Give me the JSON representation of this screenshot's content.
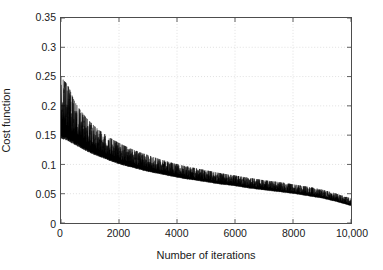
{
  "chart_data": {
    "type": "line",
    "title": "",
    "xlabel": "Number of iterations",
    "ylabel": "Cost function",
    "xlim": [
      0,
      10000
    ],
    "ylim": [
      0,
      0.35
    ],
    "grid": true,
    "legend": false,
    "legend_position": "none",
    "xticks": [
      0,
      2000,
      4000,
      6000,
      8000,
      10000
    ],
    "xticklabels": [
      "0",
      "2000",
      "4000",
      "6000",
      "8000",
      "10,000"
    ],
    "yticks": [
      0,
      0.05,
      0.1,
      0.15,
      0.2,
      0.25,
      0.3,
      0.35
    ],
    "yticklabels": [
      "0",
      "0.05",
      "0.1",
      "0.15",
      "0.2",
      "0.25",
      "0.3",
      "0.35"
    ],
    "line_color": "#000000",
    "series": [
      {
        "name": "Cost function upper envelope",
        "x": [
          0,
          100,
          200,
          300,
          400,
          500,
          700,
          900,
          1100,
          1300,
          1500,
          1800,
          2100,
          2400,
          2700,
          3000,
          3400,
          3800,
          4200,
          4600,
          5000,
          5500,
          6000,
          6500,
          7000,
          7500,
          8000,
          8500,
          9000,
          9500,
          10000
        ],
        "values": [
          0.25,
          0.243,
          0.238,
          0.228,
          0.215,
          0.205,
          0.19,
          0.178,
          0.168,
          0.159,
          0.152,
          0.142,
          0.134,
          0.127,
          0.121,
          0.116,
          0.109,
          0.103,
          0.098,
          0.094,
          0.09,
          0.085,
          0.081,
          0.077,
          0.073,
          0.07,
          0.066,
          0.062,
          0.057,
          0.05,
          0.042
        ]
      },
      {
        "name": "Cost function lower envelope",
        "x": [
          0,
          100,
          200,
          300,
          400,
          500,
          700,
          900,
          1100,
          1300,
          1500,
          1800,
          2100,
          2400,
          2700,
          3000,
          3400,
          3800,
          4200,
          4600,
          5000,
          5500,
          6000,
          6500,
          7000,
          7500,
          8000,
          8500,
          9000,
          9500,
          10000
        ],
        "values": [
          0.15,
          0.148,
          0.146,
          0.143,
          0.14,
          0.137,
          0.131,
          0.125,
          0.12,
          0.116,
          0.112,
          0.106,
          0.101,
          0.097,
          0.093,
          0.089,
          0.085,
          0.081,
          0.077,
          0.074,
          0.071,
          0.067,
          0.064,
          0.06,
          0.057,
          0.054,
          0.051,
          0.047,
          0.043,
          0.037,
          0.03
        ]
      },
      {
        "name": "Cost function mean",
        "x": [
          0,
          500,
          1000,
          2000,
          3000,
          4000,
          5000,
          6000,
          7000,
          8000,
          9000,
          10000
        ],
        "values": [
          0.2,
          0.171,
          0.148,
          0.118,
          0.103,
          0.09,
          0.081,
          0.073,
          0.065,
          0.059,
          0.05,
          0.036
        ]
      }
    ]
  },
  "axes": {
    "xlabel": "Number of iterations",
    "ylabel": "Cost function"
  }
}
